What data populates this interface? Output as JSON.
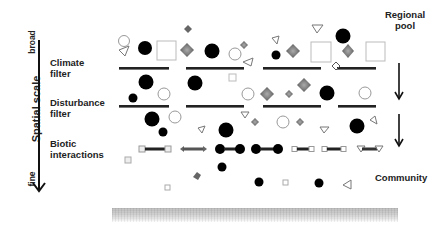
{
  "axis": {
    "title": "Spatial scale",
    "top_label": "broad",
    "bottom_label": "fine"
  },
  "filters": [
    {
      "line1": "Climate",
      "line2": "filter"
    },
    {
      "line1": "Disturbance",
      "line2": "filter"
    },
    {
      "line1": "Biotic",
      "line2": "interactions"
    }
  ],
  "right_labels": {
    "regional_pool_line1": "Regional",
    "regional_pool_line2": "pool",
    "community": "Community"
  },
  "colors": {
    "ink": "#111111",
    "filled_species": "#000000",
    "diamond_species": "#777777",
    "open_outline": "#999999",
    "filter_bar": "#222222",
    "ground": "#c0c0c0"
  },
  "legend_shapes": [
    "filled-circle",
    "open-circle",
    "open-square",
    "grey-diamond",
    "open-triangle"
  ]
}
